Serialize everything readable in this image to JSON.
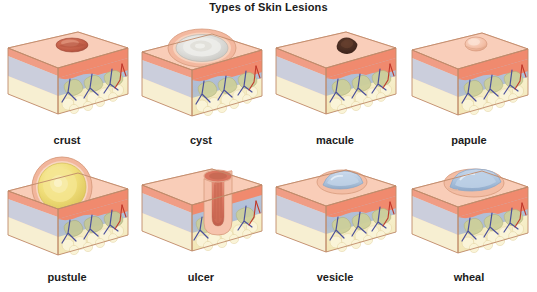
{
  "figure": {
    "title": "Types of Skin Lesions",
    "background_color": "#ffffff",
    "title_color": "#1b1b1b",
    "rows": 2,
    "columns": 4
  },
  "palette": {
    "epidermis_top": "#f6c3ad",
    "epidermis_top_light": "#fbdac9",
    "epidermis_front": "#ef9a80",
    "epidermis_band": "#f08a6e",
    "dermis": "#aebcd4",
    "dermis_light": "#c3cee0",
    "collagen": "#cdcf9a",
    "collagen_dark": "#b8bd86",
    "fat": "#f6efc9",
    "fat_edge": "#e7d9a4",
    "vein_blue": "#4a4f9c",
    "artery_red": "#c0392b",
    "outline": "#c08a6a",
    "crust_brown": "#bf5b45",
    "cyst_white": "#e8e8e6",
    "macule_dark": "#4a2d22",
    "pustule_yellow": "#f0de7a",
    "ulcer_red": "#d9745f",
    "vesicle_blue": "#aec4dc",
    "wheal_blue": "#a9c2de"
  },
  "panels": [
    {
      "id": "crust",
      "label": "crust",
      "lesion_type": "crust",
      "row": 1,
      "column": 1,
      "description": "Raised brown-red dried exudate on the skin surface with a central depression"
    },
    {
      "id": "cyst",
      "label": "cyst",
      "lesion_type": "cyst",
      "row": 1,
      "column": 2,
      "description": "Large encapsulated whitish-grey fluid filled sac elevating the epidermis"
    },
    {
      "id": "macule",
      "label": "macule",
      "lesion_type": "macule",
      "row": 1,
      "column": 3,
      "description": "Flat circumscribed dark brown discoloration flush with the skin surface"
    },
    {
      "id": "papule",
      "label": "papule",
      "lesion_type": "papule",
      "row": 1,
      "column": 4,
      "description": "Small solid raised skin-colored elevation less than one centimetre"
    },
    {
      "id": "pustule",
      "label": "pustule",
      "lesion_type": "pustule",
      "row": 2,
      "column": 1,
      "description": "Large dome shaped elevation filled with yellow purulent fluid"
    },
    {
      "id": "ulcer",
      "label": "ulcer",
      "lesion_type": "ulcer",
      "row": 2,
      "column": 2,
      "description": "Deep crater with loss of epidermis and dermis exposing red tissue base"
    },
    {
      "id": "vesicle",
      "label": "vesicle",
      "lesion_type": "vesicle",
      "row": 2,
      "column": 3,
      "description": "Small blister containing clear serous fluid within the epidermis"
    },
    {
      "id": "wheal",
      "label": "wheal",
      "lesion_type": "wheal",
      "row": 2,
      "column": 4,
      "description": "Broad flat topped transient edematous elevation of the dermis"
    }
  ],
  "skin_layers": [
    {
      "name": "epidermis",
      "color": "#f08a6e"
    },
    {
      "name": "dermis",
      "color": "#aebcd4"
    },
    {
      "name": "collagen",
      "color": "#cdcf9a"
    },
    {
      "name": "subcutaneous-fat",
      "color": "#f6efc9"
    }
  ]
}
